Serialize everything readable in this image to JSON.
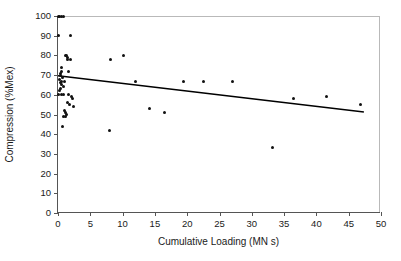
{
  "chart_data": {
    "type": "scatter",
    "title": "",
    "xlabel": "Cumulative Loading (MN s)",
    "ylabel": "Compression (%Mex)",
    "xlim": [
      0,
      50
    ],
    "ylim": [
      0,
      100
    ],
    "xticks": [
      0,
      5,
      10,
      15,
      20,
      25,
      30,
      35,
      40,
      45,
      50
    ],
    "yticks": [
      0,
      10,
      20,
      30,
      40,
      50,
      60,
      70,
      80,
      90,
      100
    ],
    "grid": false,
    "legend": null,
    "marker_color": "#111111",
    "trendline_color": "#000000",
    "series": [
      {
        "name": "Compression vs Cumulative Loading",
        "points": [
          [
            0.1,
            100
          ],
          [
            0.3,
            100
          ],
          [
            0.5,
            100
          ],
          [
            0.8,
            100
          ],
          [
            0.15,
            90
          ],
          [
            2.0,
            90
          ],
          [
            1.1,
            80
          ],
          [
            1.3,
            80
          ],
          [
            1.5,
            79
          ],
          [
            1.4,
            78
          ],
          [
            1.9,
            78
          ],
          [
            10.2,
            80
          ],
          [
            8.1,
            78
          ],
          [
            0.6,
            74
          ],
          [
            0.5,
            72
          ],
          [
            1.6,
            72
          ],
          [
            0.4,
            71
          ],
          [
            0.45,
            70
          ],
          [
            0.7,
            69
          ],
          [
            0.3,
            68
          ],
          [
            0.5,
            67
          ],
          [
            1.0,
            67
          ],
          [
            0.35,
            66
          ],
          [
            0.55,
            65
          ],
          [
            0.8,
            64
          ],
          [
            0.4,
            63
          ],
          [
            0.25,
            62
          ],
          [
            12.0,
            67
          ],
          [
            19.5,
            67
          ],
          [
            22.5,
            67
          ],
          [
            27.0,
            67
          ],
          [
            0.1,
            60
          ],
          [
            0.5,
            60
          ],
          [
            0.9,
            60
          ],
          [
            1.6,
            60
          ],
          [
            2.1,
            59
          ],
          [
            2.3,
            58
          ],
          [
            1.4,
            56
          ],
          [
            1.8,
            55
          ],
          [
            2.4,
            54
          ],
          [
            1.0,
            52
          ],
          [
            1.2,
            51
          ],
          [
            1.3,
            50
          ],
          [
            1.1,
            49
          ],
          [
            14.2,
            53
          ],
          [
            16.5,
            51
          ],
          [
            36.5,
            58
          ],
          [
            41.5,
            59
          ],
          [
            46.8,
            55
          ],
          [
            0.9,
            49
          ],
          [
            0.7,
            44
          ],
          [
            8.0,
            42
          ],
          [
            33.2,
            33
          ]
        ]
      }
    ],
    "trendline": {
      "x1": 0,
      "y1": 69.5,
      "x2": 47.5,
      "y2": 51.0
    }
  }
}
